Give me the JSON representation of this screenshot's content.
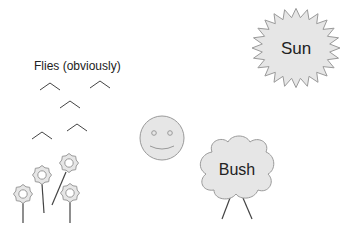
{
  "labels": {
    "flies": "Flies (obviously)",
    "sun": "Sun",
    "bush": "Bush"
  },
  "colors": {
    "fill": "#e6e6e6",
    "stroke": "#9a9a9a",
    "line": "#444444",
    "text": "#222222"
  },
  "flies": [
    {
      "x": 50,
      "y": 86
    },
    {
      "x": 100,
      "y": 84
    },
    {
      "x": 70,
      "y": 104
    },
    {
      "x": 77,
      "y": 127
    },
    {
      "x": 42,
      "y": 135
    }
  ],
  "flowers": [
    {
      "cx": 23,
      "cy": 194,
      "stem": [
        23,
        203,
        23,
        223
      ]
    },
    {
      "cx": 42,
      "cy": 175,
      "stem": [
        42,
        184,
        44,
        213
      ]
    },
    {
      "cx": 69,
      "cy": 163,
      "stem": [
        66,
        172,
        52,
        205
      ]
    },
    {
      "cx": 70,
      "cy": 193,
      "stem": [
        70,
        202,
        70,
        223
      ]
    }
  ],
  "smiley": {
    "cx": 162,
    "cy": 138,
    "r": 22
  },
  "sun": {
    "cx": 296,
    "cy": 48,
    "outer": 44,
    "inner": 34,
    "points": 24
  },
  "bush": {
    "cx": 237,
    "cy": 169
  }
}
